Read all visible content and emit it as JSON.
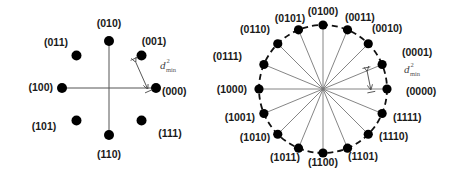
{
  "figure": {
    "left": {
      "name": "8-PSK constellation",
      "center": [
        109,
        88
      ],
      "radius": 48,
      "point_color": "#000000",
      "axis_color": "#555555",
      "points": [
        {
          "label": "(000)",
          "angle": 0,
          "lx": 162,
          "ly": 95,
          "anchor": "start"
        },
        {
          "label": "(001)",
          "angle": 45,
          "lx": 154,
          "ly": 45,
          "anchor": "middle"
        },
        {
          "label": "(010)",
          "angle": 90,
          "lx": 109,
          "ly": 27,
          "anchor": "middle"
        },
        {
          "label": "(011)",
          "angle": 135,
          "lx": 56,
          "ly": 46,
          "anchor": "middle"
        },
        {
          "label": "(100)",
          "angle": 180,
          "lx": 53,
          "ly": 91,
          "anchor": "end"
        },
        {
          "label": "(101)",
          "angle": 225,
          "lx": 44,
          "ly": 130,
          "anchor": "middle"
        },
        {
          "label": "(110)",
          "angle": 270,
          "lx": 109,
          "ly": 158,
          "anchor": "middle"
        },
        {
          "label": "(111)",
          "angle": 315,
          "lx": 170,
          "ly": 137,
          "anchor": "middle"
        }
      ],
      "dmin_label": "d",
      "dmin_sup": "2",
      "dmin_sub": "min"
    },
    "right": {
      "name": "16-PSK constellation",
      "center": [
        323,
        89
      ],
      "radius": 64,
      "point_color": "#000000",
      "spoke_color": "#777777",
      "circle_dash": "6,4",
      "points": [
        {
          "label": "(0000)",
          "angle": 0,
          "lx": 406,
          "ly": 95,
          "anchor": "start"
        },
        {
          "label": "(0001)",
          "angle": 22.5,
          "lx": 402,
          "ly": 56,
          "anchor": "start"
        },
        {
          "label": "(0010)",
          "angle": 45,
          "lx": 372,
          "ly": 32,
          "anchor": "start"
        },
        {
          "label": "(0011)",
          "angle": 67.5,
          "lx": 345,
          "ly": 21,
          "anchor": "start"
        },
        {
          "label": "(0100)",
          "angle": 90,
          "lx": 323,
          "ly": 15,
          "anchor": "middle"
        },
        {
          "label": "(0101)",
          "angle": 112.5,
          "lx": 290,
          "ly": 22,
          "anchor": "middle"
        },
        {
          "label": "(0110)",
          "angle": 135,
          "lx": 255,
          "ly": 33,
          "anchor": "middle"
        },
        {
          "label": "(0111)",
          "angle": 157.5,
          "lx": 242,
          "ly": 60,
          "anchor": "end"
        },
        {
          "label": "(1000)",
          "angle": 180,
          "lx": 247,
          "ly": 93,
          "anchor": "end"
        },
        {
          "label": "(1001)",
          "angle": 202.5,
          "lx": 255,
          "ly": 121,
          "anchor": "end"
        },
        {
          "label": "(1010)",
          "angle": 225,
          "lx": 255,
          "ly": 141,
          "anchor": "middle"
        },
        {
          "label": "(1011)",
          "angle": 247.5,
          "lx": 285,
          "ly": 161,
          "anchor": "middle"
        },
        {
          "label": "(1100)",
          "angle": 270,
          "lx": 323,
          "ly": 166,
          "anchor": "middle"
        },
        {
          "label": "(1101)",
          "angle": 292.5,
          "lx": 363,
          "ly": 160,
          "anchor": "middle"
        },
        {
          "label": "(1110)",
          "angle": 315,
          "lx": 379,
          "ly": 140,
          "anchor": "start"
        },
        {
          "label": "(1111)",
          "angle": 337.5,
          "lx": 393,
          "ly": 121,
          "anchor": "start"
        }
      ],
      "dmin_label": "d",
      "dmin_sup": "2",
      "dmin_sub": "min"
    }
  }
}
